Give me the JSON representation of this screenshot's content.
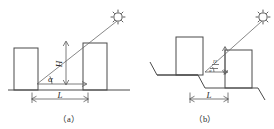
{
  "figure": {
    "stroke_color": "#4a4a4a",
    "background_color": "#ffffff",
    "panels": [
      {
        "id": "panel-a",
        "caption": "（a）",
        "terrain": "flat",
        "labels": {
          "height": "H",
          "angle": "α",
          "spacing": "L"
        },
        "icons": {
          "sun": "sun-icon"
        }
      },
      {
        "id": "panel-b",
        "caption": "（b）",
        "terrain": "stepped",
        "labels": {
          "spacing": "L",
          "height": "H",
          "angle": "α"
        },
        "icons": {
          "sun": "sun-icon"
        }
      }
    ]
  }
}
